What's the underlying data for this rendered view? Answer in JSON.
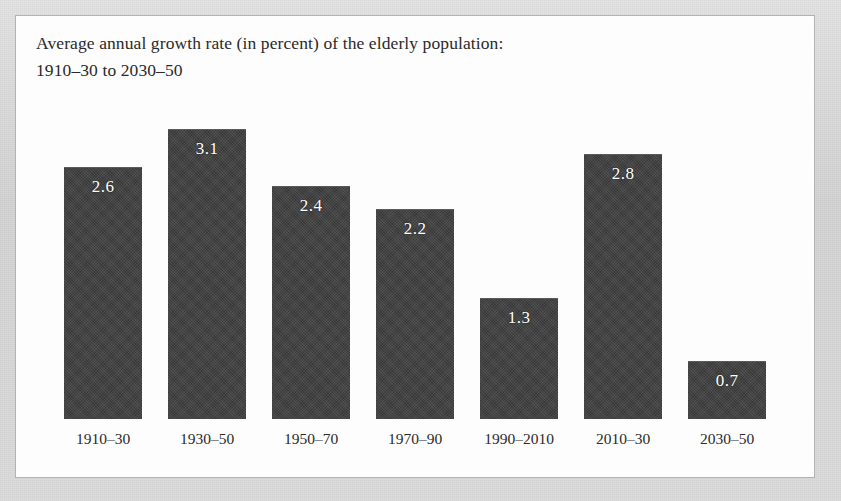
{
  "figure": {
    "title_line_1": "Average annual growth rate (in percent) of the elderly population:",
    "title_line_2": "1910–30 to 2030–50",
    "bar_color": "#3f3f3f",
    "value_label_color": "#ffffff",
    "panel_color": "#fdfdfd",
    "frame_color": "#d9d9d9"
  },
  "chart_data": {
    "type": "bar",
    "title": "Average annual growth rate (in percent) of the elderly population: 1910–30 to 2030–50",
    "xlabel": "",
    "ylabel": "",
    "ylim": [
      0,
      3.1
    ],
    "grid": false,
    "legend": "none",
    "categories": [
      "1910–30",
      "1930–50",
      "1950–70",
      "1970–90",
      "1990–2010",
      "2010–30",
      "2030–50"
    ],
    "values": [
      2.6,
      3.1,
      2.4,
      2.2,
      1.3,
      2.8,
      0.7
    ],
    "value_labels": [
      "2.6",
      "3.1",
      "2.4",
      "2.2",
      "1.3",
      "2.8",
      "0.7"
    ],
    "bars": [
      {
        "category": "1910–30",
        "value": 2.6,
        "label": "2.6",
        "left": 48,
        "width": 78,
        "top": 151,
        "height": 252
      },
      {
        "category": "1930–50",
        "value": 3.1,
        "label": "3.1",
        "left": 152,
        "width": 78,
        "top": 113,
        "height": 290
      },
      {
        "category": "1950–70",
        "value": 2.4,
        "label": "2.4",
        "left": 256,
        "width": 78,
        "top": 170,
        "height": 233
      },
      {
        "category": "1970–90",
        "value": 2.2,
        "label": "2.2",
        "left": 360,
        "width": 78,
        "top": 193,
        "height": 210
      },
      {
        "category": "1990–2010",
        "value": 1.3,
        "label": "1.3",
        "left": 464,
        "width": 78,
        "top": 282,
        "height": 121
      },
      {
        "category": "2010–30",
        "value": 2.8,
        "label": "2.8",
        "left": 568,
        "width": 78,
        "top": 138,
        "height": 265
      },
      {
        "category": "2030–50",
        "value": 0.7,
        "label": "0.7",
        "left": 672,
        "width": 78,
        "top": 345,
        "height": 58
      }
    ],
    "baseline_y": 403,
    "axis_label_y": 415
  }
}
